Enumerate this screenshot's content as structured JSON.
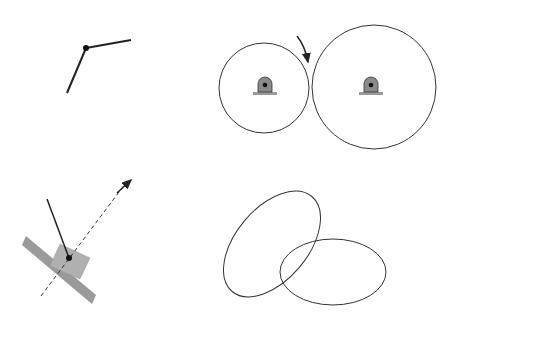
{
  "panel_a": {
    "label_joint": "(23)",
    "link_2": "2",
    "link_3": "3",
    "rule": "First rule",
    "tag": "(a)"
  },
  "panel_b": {
    "label_contact": "(23)",
    "link_2": "2",
    "link_3": "3",
    "pivot_12": "(12)",
    "pivot_13": "(13)",
    "rule": "Second rule",
    "tag": "(b)"
  },
  "panel_c": {
    "infinity_label": "13 at infinity",
    "infinity_symbol": "(13∞)",
    "link_1": "1",
    "link_2": "2",
    "link_3": "3",
    "label_joint": "(23)",
    "rule": "Third rule",
    "tag": "(c)"
  },
  "panel_d": {
    "link_2": "2",
    "link_3": "3",
    "pivot_12": "(12)",
    "pivot_13": "(13)",
    "rule": "Fourth rule",
    "tag": "(d)",
    "normal_label": "23 along this common normal",
    "normal_sub": "(23)"
  },
  "colors": {
    "line": "#222222",
    "block_fill": "#b0b0b0",
    "ground_fill": "#9a9a9a"
  }
}
